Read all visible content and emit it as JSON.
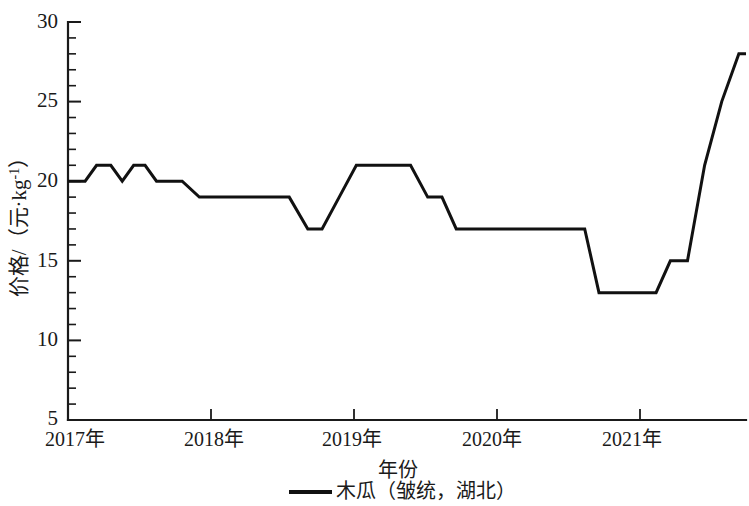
{
  "chart_data": {
    "type": "line",
    "title": "",
    "xlabel": "年份",
    "ylabel": "价格/（元·kg⁻¹）",
    "ylabel_parts": {
      "prefix": "价格/（元·kg",
      "exponent": "-1",
      "suffix": "）"
    },
    "ylim": [
      5,
      30
    ],
    "xlim": [
      2017.0,
      2021.75
    ],
    "grid": false,
    "y_major_ticks": [
      5,
      10,
      15,
      20,
      25,
      30
    ],
    "y_major_tick_labels": [
      "5",
      "10",
      "15",
      "20",
      "25",
      "30"
    ],
    "y_minor_tick_step": 1,
    "x_ticks": [
      2017,
      2018,
      2019,
      2020,
      2021
    ],
    "x_tick_labels": [
      "2017年",
      "2018年",
      "2019年",
      "2020年",
      "2021年"
    ],
    "legend_position": "below-center",
    "legend": [
      "木瓜（皱统，湖北）"
    ],
    "series": [
      {
        "name": "木瓜（皱统，湖北）",
        "color": "#111111",
        "x": [
          2017.0,
          2017.12,
          2017.2,
          2017.3,
          2017.38,
          2017.46,
          2017.54,
          2017.62,
          2017.7,
          2017.8,
          2017.92,
          2018.0,
          2018.3,
          2018.55,
          2018.68,
          2018.78,
          2018.9,
          2019.02,
          2019.12,
          2019.4,
          2019.52,
          2019.62,
          2019.72,
          2019.84,
          2019.95,
          2020.1,
          2020.3,
          2020.62,
          2020.72,
          2020.82,
          2021.12,
          2021.22,
          2021.34,
          2021.46,
          2021.58,
          2021.7,
          2021.75
        ],
        "y": [
          20,
          20,
          21,
          21,
          20,
          21,
          21,
          20,
          20,
          20,
          19,
          19,
          19,
          19,
          17,
          17,
          19,
          21,
          21,
          21,
          19,
          19,
          17,
          17,
          17,
          17,
          17,
          17,
          13,
          13,
          13,
          15,
          15,
          21,
          25,
          28,
          28
        ],
        "vertices_note": "step-like line with sloped transitions"
      }
    ]
  },
  "axis": {
    "y_label_text": "价格/（元·kg",
    "y_label_exp": "-1",
    "y_label_tail": "）",
    "x_label_text": "年份"
  }
}
